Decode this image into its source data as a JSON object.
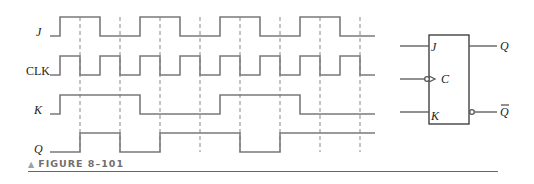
{
  "figure": {
    "caption_marker": "▲",
    "caption": "FIGURE 8–101"
  },
  "timing_diagram": {
    "signals": [
      {
        "name": "J",
        "label": "J",
        "edges_x": [
          60,
          100,
          140,
          180,
          220,
          260,
          300,
          340
        ],
        "initial": 0
      },
      {
        "name": "CLK",
        "label": "CLK",
        "edges_x": [
          60,
          80,
          100,
          120,
          140,
          160,
          180,
          200,
          220,
          240,
          260,
          280,
          300,
          320,
          340,
          360
        ],
        "initial": 0
      },
      {
        "name": "K",
        "label": "K",
        "edges_x": [
          60,
          140,
          220,
          300
        ],
        "initial": 0
      },
      {
        "name": "Q",
        "label": "Q",
        "edges_x": [
          80,
          120,
          160,
          240,
          280
        ],
        "initial": 0
      }
    ],
    "clock_trigger": "negative-edge",
    "dashed_markers_x": [
      80,
      120,
      160,
      200,
      240,
      280,
      320,
      360
    ]
  },
  "flip_flop": {
    "type": "J-K flip-flop (negative edge triggered)",
    "inputs": [
      "J",
      "C",
      "K"
    ],
    "outputs": [
      "Q",
      "Q̄"
    ],
    "out_q": "Q",
    "out_qbar": "Q"
  },
  "colors": {
    "waveform": "#7a7a7a",
    "text": "#222222",
    "caption": "#6f6f70"
  }
}
